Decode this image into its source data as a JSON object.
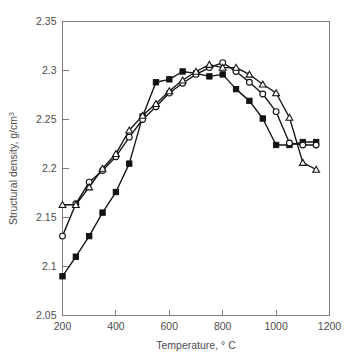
{
  "chart_data": {
    "type": "line",
    "title": "",
    "xlabel": "Temperature, ° C",
    "xlabel_main": "Temperature, ",
    "xlabel_unit": "° C",
    "ylabel": "Structural density, g/cm3",
    "ylabel_main": "Structural density, g/cm",
    "ylabel_sup": "3",
    "xlim": [
      200,
      1200
    ],
    "ylim": [
      2.05,
      2.35
    ],
    "xticks": [
      200,
      400,
      600,
      800,
      1000,
      1200
    ],
    "xtick_labels": [
      "200",
      "400",
      "600",
      "800",
      "1000",
      "1200"
    ],
    "yticks": [
      2.05,
      2.1,
      2.15,
      2.2,
      2.25,
      2.3,
      2.35
    ],
    "ytick_labels": [
      "2.05",
      "2.1",
      "2.15",
      "2.2",
      "2.25",
      "2.3",
      "2.35"
    ],
    "grid": false,
    "legend": "none",
    "series": [
      {
        "name": "filled-square",
        "marker": "filled-square",
        "x": [
          200,
          250,
          300,
          350,
          400,
          450,
          500,
          550,
          600,
          650,
          700,
          750,
          800,
          850,
          900,
          950,
          1000,
          1050,
          1100,
          1150
        ],
        "y": [
          2.09,
          2.11,
          2.131,
          2.155,
          2.176,
          2.205,
          2.253,
          2.288,
          2.291,
          2.299,
          2.297,
          2.294,
          2.296,
          2.281,
          2.269,
          2.251,
          2.224,
          2.224,
          2.227,
          2.227
        ]
      },
      {
        "name": "open-circle",
        "marker": "open-circle",
        "x": [
          200,
          250,
          300,
          350,
          400,
          450,
          500,
          550,
          600,
          650,
          700,
          750,
          800,
          850,
          900,
          950,
          1000,
          1050,
          1100,
          1150
        ],
        "y": [
          2.131,
          2.164,
          2.186,
          2.198,
          2.212,
          2.232,
          2.25,
          2.263,
          2.277,
          2.287,
          2.296,
          2.303,
          2.308,
          2.299,
          2.288,
          2.276,
          2.258,
          2.226,
          2.224,
          2.224
        ]
      },
      {
        "name": "open-triangle",
        "marker": "open-triangle",
        "x": [
          200,
          250,
          300,
          350,
          400,
          450,
          500,
          550,
          600,
          650,
          700,
          750,
          800,
          850,
          900,
          950,
          1000,
          1050,
          1100,
          1150
        ],
        "y": [
          2.163,
          2.163,
          2.181,
          2.2,
          2.215,
          2.239,
          2.254,
          2.266,
          2.279,
          2.29,
          2.299,
          2.306,
          2.303,
          2.303,
          2.296,
          2.286,
          2.277,
          2.252,
          2.206,
          2.199
        ]
      }
    ]
  }
}
